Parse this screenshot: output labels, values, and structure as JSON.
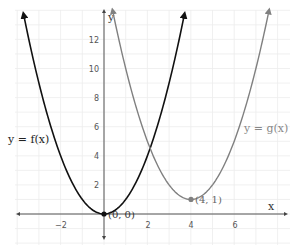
{
  "chart_data": {
    "type": "line",
    "title": "",
    "xlabel": "x",
    "ylabel": "y",
    "xlim": [
      -4.5,
      7.5
    ],
    "ylim": [
      -2.5,
      14
    ],
    "grid": true,
    "x_ticks": [
      -2,
      2,
      4,
      6
    ],
    "y_ticks": [
      2,
      4,
      6,
      8,
      10,
      12
    ],
    "series": [
      {
        "name": "y = f(x)",
        "formula": "x^2",
        "color": "#111111",
        "x_range": [
          -3.7,
          3.7
        ],
        "vertex": [
          0,
          0
        ]
      },
      {
        "name": "y = g(x)",
        "formula": "(x-4)^2 + 1",
        "color": "#808080",
        "x_range": [
          0.4,
          7.6
        ],
        "vertex": [
          4,
          1
        ]
      }
    ],
    "annotations": [
      {
        "text": "(0, 0)",
        "x": 0,
        "y": 0
      },
      {
        "text": "(4, 1)",
        "x": 4,
        "y": 1
      }
    ]
  },
  "labels": {
    "f": "y = f(x)",
    "g": "y = g(x)",
    "x_axis": "x",
    "y_axis": "y",
    "p0": "(0, 0)",
    "p1": "(4, 1)",
    "ticks": {
      "xm2": "−2",
      "x2": "2",
      "x4": "4",
      "x6": "6",
      "y2": "2",
      "y4": "4",
      "y6": "6",
      "y8": "8",
      "y10": "10",
      "y12": "12"
    }
  }
}
